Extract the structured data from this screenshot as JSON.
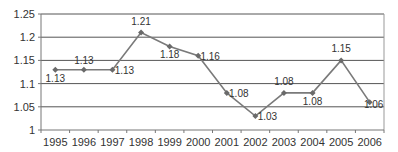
{
  "chart_data": {
    "type": "line",
    "title": "",
    "xlabel": "",
    "ylabel": "",
    "categories": [
      "1995",
      "1996",
      "1997",
      "1998",
      "1999",
      "2000",
      "2001",
      "2002",
      "2003",
      "2004",
      "2005",
      "2006"
    ],
    "series": [
      {
        "name": "Series 1",
        "values": [
          1.13,
          1.13,
          1.13,
          1.21,
          1.18,
          1.16,
          1.08,
          1.03,
          1.08,
          1.08,
          1.15,
          1.06
        ]
      }
    ],
    "data_labels": [
      "1.13",
      "1.13",
      "1.13",
      "1.21",
      "1.18",
      "1.16",
      "1.08",
      "1.03",
      "1.08",
      "1.08",
      "1.15",
      "1.06"
    ],
    "y_ticks": [
      "1",
      "1.05",
      "1.1",
      "1.15",
      "1.2",
      "1.25"
    ],
    "ylim": [
      1,
      1.25
    ],
    "grid": true,
    "legend": "none",
    "colors": {
      "line": "#7a7a7a",
      "marker": "#6a6a6a",
      "grid": "#555555",
      "axis": "#777777"
    }
  }
}
